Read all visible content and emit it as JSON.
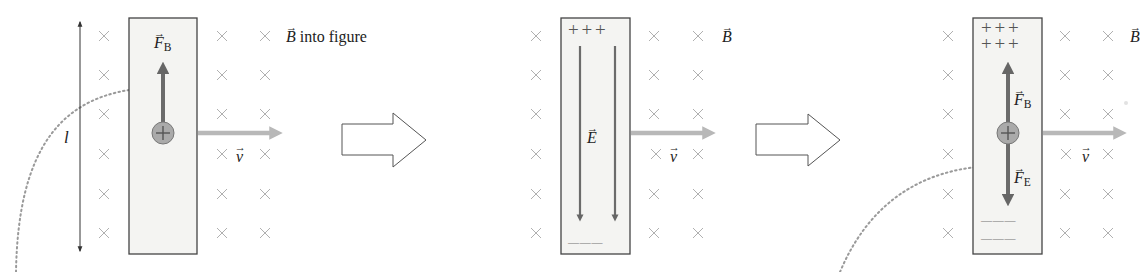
{
  "figure": {
    "colors": {
      "background": "#ffffff",
      "bar_fill": "#f4f4f2",
      "bar_border": "#444444",
      "cross": "#b0b0b0",
      "force_arrow": "#6b6b6b",
      "velocity_arrow": "#b8b8b8",
      "charge_fill": "#aaaaaa",
      "dotted_curve": "#9a9a9a",
      "text": "#222222"
    },
    "field_symbol": "×",
    "transition_arrows": 2,
    "panels": [
      {
        "id": "panel-1",
        "length_label": "l",
        "field_label": {
          "symbol": "B",
          "suffix": " into figure"
        },
        "force_label": {
          "symbol": "F",
          "subscript": "B"
        },
        "velocity_label": {
          "symbol": "v"
        },
        "charge_sign": "+",
        "top_charges": [],
        "bottom_charges": []
      },
      {
        "id": "panel-2",
        "field_label": {
          "symbol": "B",
          "suffix": ""
        },
        "efield_label": {
          "symbol": "E"
        },
        "velocity_label": {
          "symbol": "v"
        },
        "top_charges": [
          "+ + +"
        ],
        "bottom_charges": [
          "— — —"
        ]
      },
      {
        "id": "panel-3",
        "field_label": {
          "symbol": "B",
          "suffix": ""
        },
        "force_b_label": {
          "symbol": "F",
          "subscript": "B"
        },
        "force_e_label": {
          "symbol": "F",
          "subscript": "E"
        },
        "velocity_label": {
          "symbol": "v"
        },
        "charge_sign": "+",
        "top_charges": [
          "+ + +",
          "+ + +"
        ],
        "bottom_charges": [
          "— — —",
          "— — —"
        ]
      }
    ]
  }
}
